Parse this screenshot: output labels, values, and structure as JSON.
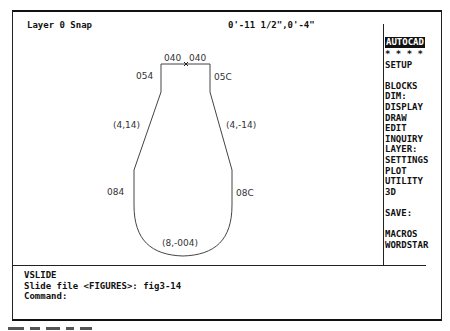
{
  "status_bar": {
    "layer_snap": "Layer 0 Snap",
    "coordinates": "0'-11 1/2\",0'-4\""
  },
  "screen_menu": {
    "items": [
      {
        "label": "AUTOCAD",
        "active": true
      },
      {
        "label": "* * * *"
      },
      {
        "label": "SETUP"
      },
      {
        "label": ""
      },
      {
        "label": "BLOCKS"
      },
      {
        "label": "DIM:"
      },
      {
        "label": "DISPLAY"
      },
      {
        "label": "DRAW"
      },
      {
        "label": "EDIT"
      },
      {
        "label": "INQUIRY"
      },
      {
        "label": "LAYER:"
      },
      {
        "label": "SETTINGS"
      },
      {
        "label": "PLOT"
      },
      {
        "label": "UTILITY"
      },
      {
        "label": "3D"
      },
      {
        "label": ""
      },
      {
        "label": "SAVE:"
      },
      {
        "label": ""
      },
      {
        "label": "MACROS"
      },
      {
        "label": "WORDSTAR"
      }
    ]
  },
  "drawing": {
    "labels": {
      "top_left": "040",
      "top_right": "040",
      "upper_left_side": "054",
      "upper_right_side": "05C",
      "left_slope": "(4,14)",
      "right_slope": "(4,-14)",
      "lower_left_side": "084",
      "lower_right_side": "08C",
      "bottom_arc": "(8,-004)"
    },
    "colors": {
      "line": "#444444",
      "text": "#333333"
    }
  },
  "command_area": {
    "lines": [
      "VSLIDE",
      "Slide file <FIGURES>: fig3-14",
      "Command:"
    ]
  }
}
